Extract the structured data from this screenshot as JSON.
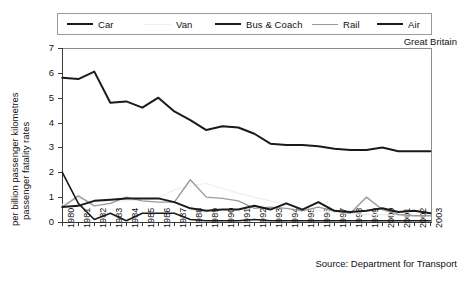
{
  "chart_data": {
    "type": "line",
    "title": "",
    "region_label": "Great Britain",
    "source": "Source: Department for Transport",
    "xlabel": "",
    "ylabel": "passenger fatality rates per billion passenger kilometres",
    "ylabel_line1": "passenger fatality rates",
    "ylabel_line2": "per billion passenger kilometres",
    "ylim": [
      0,
      7
    ],
    "yticks": [
      0,
      1,
      2,
      3,
      4,
      5,
      6,
      7
    ],
    "grid": false,
    "legend_position": "top",
    "x": [
      "1980",
      "1981",
      "1982",
      "1983",
      "1984",
      "1985",
      "1986",
      "1987",
      "1988",
      "1989",
      "1990",
      "1991",
      "1992",
      "1993",
      "1994",
      "1995",
      "1996",
      "1997",
      "1998",
      "1999",
      "2000",
      "2001",
      "2002",
      "2003"
    ],
    "categories": [
      "1980",
      "1981",
      "1982",
      "1983",
      "1984",
      "1985",
      "1986",
      "1987",
      "1988",
      "1989",
      "1990",
      "1991",
      "1992",
      "1993",
      "1994",
      "1995",
      "1996",
      "1997",
      "1998",
      "1999",
      "2000",
      "2001",
      "2002",
      "2003"
    ],
    "series": [
      {
        "name": "Car",
        "color": "#1a1a1a",
        "width": 2.0,
        "values": [
          5.8,
          5.75,
          6.05,
          4.8,
          4.85,
          4.6,
          5.0,
          4.45,
          4.1,
          3.7,
          3.85,
          3.8,
          3.55,
          3.15,
          3.1,
          3.1,
          3.05,
          2.95,
          2.9,
          2.9,
          3.0,
          2.85,
          2.85,
          2.85
        ]
      },
      {
        "name": "Van",
        "color": "#efefef",
        "width": 1.2,
        "values": [
          0.7,
          0.95,
          0.8,
          0.85,
          0.85,
          0.9,
          0.95,
          1.3,
          1.45,
          1.55,
          1.35,
          1.15,
          1.0,
          0.85,
          0.7,
          0.55,
          0.45,
          0.4,
          0.35,
          0.3,
          0.3,
          0.25,
          0.25,
          0.25
        ]
      },
      {
        "name": "Bus & Coach",
        "color": "#1a1a1a",
        "width": 2.0,
        "values": [
          0.6,
          0.65,
          0.85,
          0.9,
          0.95,
          0.95,
          0.95,
          0.8,
          0.55,
          0.45,
          0.5,
          0.5,
          0.65,
          0.5,
          0.75,
          0.5,
          0.8,
          0.45,
          0.4,
          0.45,
          0.55,
          0.4,
          0.45,
          0.35
        ]
      },
      {
        "name": "Rail",
        "color": "#9a9a9a",
        "width": 1.4,
        "values": [
          0.6,
          1.05,
          0.65,
          0.75,
          1.0,
          0.85,
          0.8,
          0.8,
          1.7,
          1.0,
          0.95,
          0.85,
          0.55,
          0.6,
          0.55,
          0.45,
          0.6,
          0.45,
          0.35,
          1.0,
          0.5,
          0.3,
          0.25,
          0.25
        ]
      },
      {
        "name": "Air",
        "color": "#1a1a1a",
        "width": 1.6,
        "values": [
          2.0,
          0.75,
          0.1,
          0.35,
          0.05,
          0.35,
          0.35,
          0.35,
          0.1,
          0.05,
          0.05,
          0.05,
          0.1,
          0.05,
          0.05,
          0.05,
          0.05,
          0.05,
          0.05,
          0.05,
          0.05,
          0.05,
          0.05,
          0.05
        ]
      }
    ],
    "legend": [
      {
        "label": "Car",
        "color": "#1a1a1a",
        "width": 2.2
      },
      {
        "label": "Van",
        "color": "#efefef",
        "width": 1.6
      },
      {
        "label": "Bus & Coach",
        "color": "#1a1a1a",
        "width": 2.2
      },
      {
        "label": "Rail",
        "color": "#9a9a9a",
        "width": 1.6
      },
      {
        "label": "Air",
        "color": "#1a1a1a",
        "width": 2.2
      }
    ]
  }
}
